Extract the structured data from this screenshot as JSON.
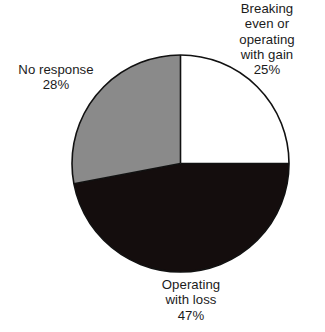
{
  "chart_data": {
    "type": "pie",
    "title": "",
    "subtitle": "",
    "xlabel": "",
    "ylabel": "",
    "grid": false,
    "legend_position": "none",
    "units": "percent",
    "total": 100,
    "start_angle_deg": 0,
    "direction": "clockwise",
    "categories": [
      "Breaking even or operating with gain",
      "Operating with loss",
      "No response"
    ],
    "values": [
      25,
      47,
      28
    ],
    "slices": [
      {
        "label": "Breaking even or operating with gain",
        "label_lines": "Breaking\neven or\noperating\nwith gain",
        "value": 25,
        "value_text": "25%",
        "color": "#ffffff",
        "outline": "#111111",
        "start_deg": 0,
        "end_deg": 90
      },
      {
        "label": "Operating with loss",
        "label_lines": "Operating\nwith loss",
        "value": 47,
        "value_text": "47%",
        "color": "#140d0d",
        "outline": "#111111",
        "start_deg": 90,
        "end_deg": 259.2
      },
      {
        "label": "No response",
        "label_lines": "No response",
        "value": 28,
        "value_text": "28%",
        "color": "#8a8a8a",
        "outline": "#111111",
        "start_deg": 259.2,
        "end_deg": 360
      }
    ]
  },
  "labels": {
    "gain": {
      "text": "Breaking\neven or\noperating\nwith gain\n25%"
    },
    "no_response": {
      "text": "No response\n28%"
    },
    "loss": {
      "text": "Operating\nwith loss\n47%"
    }
  },
  "geometry": {
    "center_x": 180.5,
    "center_y": 163.5,
    "radius": 108.5
  },
  "colors": {
    "background": "#ffffff",
    "gain_slice": "#ffffff",
    "loss_slice": "#140d0d",
    "no_response_slice": "#8a8a8a",
    "outline": "#111111",
    "text": "#1b1b1b"
  }
}
